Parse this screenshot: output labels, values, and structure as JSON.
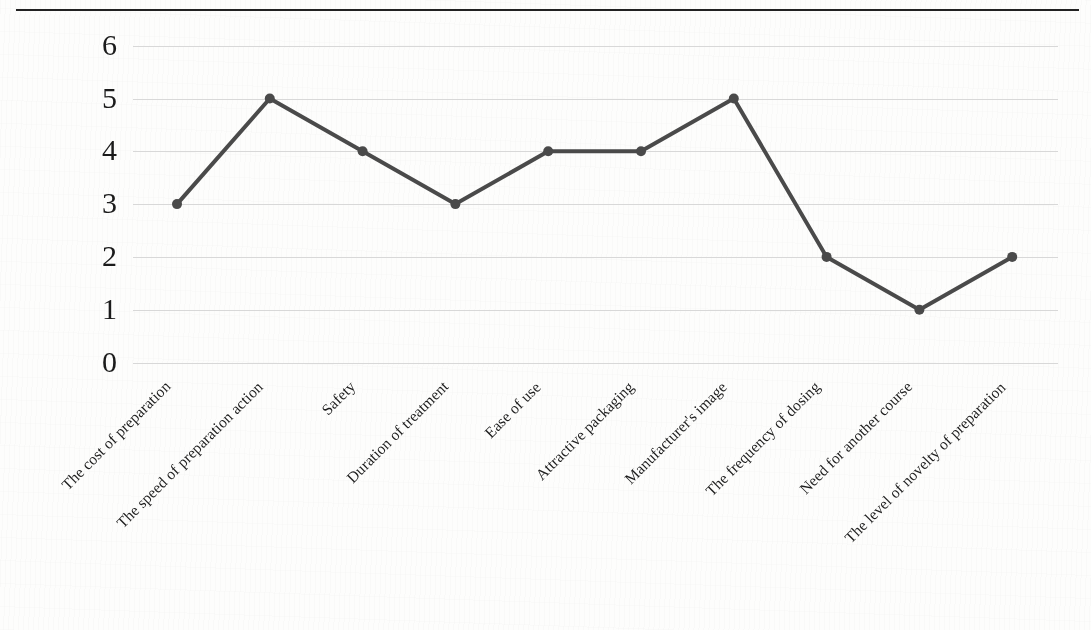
{
  "page": {
    "background_color": "#fdfdfc",
    "rule_color": "#222222"
  },
  "chart_data": {
    "type": "line",
    "title": "",
    "subtitle": "",
    "xlabel": "",
    "ylabel": "",
    "categories": [
      "The cost of preparation",
      "The speed of preparation action",
      "Safety",
      "Duration of treatment",
      "Ease of use",
      "Attractive packaging",
      "Manufacturer's image",
      "The frequency of dosing",
      "Need for another course",
      "The level of novelty of preparation"
    ],
    "values": [
      3,
      5,
      4,
      3,
      4,
      4,
      5,
      2,
      1,
      2
    ],
    "ylim": [
      0,
      6
    ],
    "yticks": [
      "0",
      "1",
      "2",
      "3",
      "4",
      "5",
      "6"
    ],
    "grid": true,
    "legend": "none",
    "series_color": "#4a4a4a",
    "grid_color": "#d8d8d8",
    "marker": "circle",
    "marker_size": 10,
    "line_width": 4
  }
}
